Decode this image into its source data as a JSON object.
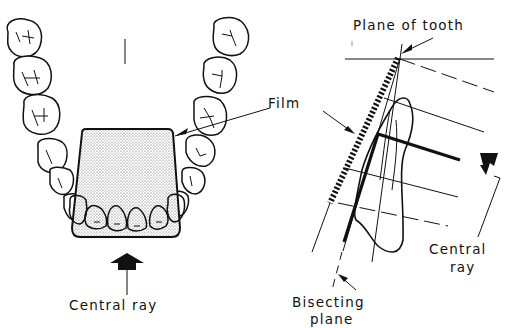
{
  "figure": {
    "left_panel": {
      "name": "occlusal view of maxillary arch with film",
      "labels": {
        "central_ray": "Central ray"
      }
    },
    "right_panel": {
      "name": "sagittal view of tooth, film and bisecting plane",
      "labels": {
        "plane_of_tooth": "Plane of tooth",
        "film": "Film",
        "central_ray_line1": "Central",
        "central_ray_line2": "ray",
        "bisecting_line1": "Bisecting",
        "bisecting_line2": "plane"
      }
    },
    "colors": {
      "ink": "#111111",
      "background": "#ffffff",
      "film_stipple": "#777777"
    }
  }
}
